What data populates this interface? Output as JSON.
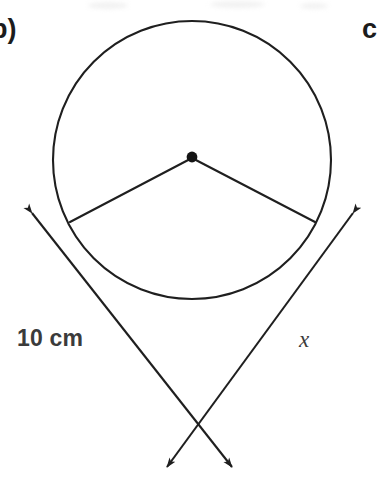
{
  "page": {
    "width": 377,
    "height": 483,
    "background_color": "#ffffff"
  },
  "labels": {
    "part_b": "b)",
    "part_c": "c",
    "length": "10 cm",
    "unknown": "x"
  },
  "colors": {
    "stroke": "#1f1f1f",
    "text": "#3b3b3b",
    "part_label": "#1c1c1c",
    "dot_fill": "#141414"
  },
  "geometry": {
    "type": "circle-with-sector-and-tangent-rays",
    "circle": {
      "center_x": 192,
      "center_y": 160,
      "radius": 139,
      "stroke_width": 2.1
    },
    "center_dot": {
      "cx": 192,
      "cy": 157,
      "r": 5.4
    },
    "radii": [
      {
        "name": "radius-left",
        "x1": 192,
        "y1": 158,
        "x2": 70,
        "y2": 222
      },
      {
        "name": "radius-right",
        "x1": 192,
        "y1": 158,
        "x2": 315,
        "y2": 222
      }
    ],
    "rays": [
      {
        "name": "ray-left-descending",
        "from_x": 32,
        "from_y": 213,
        "to_x": 232,
        "to_y": 467,
        "arrow_start": true,
        "arrow_end": true
      },
      {
        "name": "ray-right-descending",
        "from_x": 353,
        "from_y": 213,
        "to_x": 167,
        "to_y": 467,
        "arrow_start": true,
        "arrow_end": true
      }
    ],
    "vertex": {
      "x": 196,
      "y": 458
    },
    "stroke_width": 2.1
  }
}
